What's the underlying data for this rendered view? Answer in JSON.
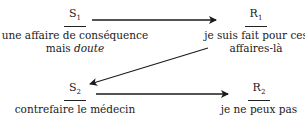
{
  "diagram": {
    "nodes": [
      {
        "id": "S1",
        "label": "S",
        "sub": "1",
        "desc_line1": "une affaire de conséquence",
        "desc_line2_plain": "mais ",
        "desc_line2_italic": "doute"
      },
      {
        "id": "R1",
        "label": "R",
        "sub": "1",
        "desc_line1": "je suis fait pour ces",
        "desc_line2": "affaires-là"
      },
      {
        "id": "S2",
        "label": "S",
        "sub": "2",
        "desc_line1": "contrefaire le médecin"
      },
      {
        "id": "R2",
        "label": "R",
        "sub": "2",
        "desc_line1": "je ne peux pas"
      }
    ],
    "edges": [
      {
        "from": "S1",
        "to": "R1"
      },
      {
        "from": "R1",
        "to": "S2"
      },
      {
        "from": "S2",
        "to": "R2"
      }
    ],
    "colors": {
      "line": "#1a1a1a",
      "background": "#ffffff"
    }
  }
}
